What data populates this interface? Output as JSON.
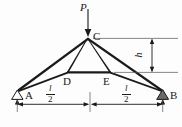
{
  "figure": {
    "type": "structural-truss-diagram",
    "background_color": "#fdfdfd",
    "line_color": "#1a1a1a",
    "labels": {
      "load": "P",
      "apex": "C",
      "left_support": "A",
      "right_support": "B",
      "left_tie_node": "D",
      "right_tie_node": "E",
      "height": "h"
    },
    "dimensions": {
      "left_span_numerator": "l",
      "left_span_denominator": "2",
      "right_span_numerator": "l",
      "right_span_denominator": "2"
    },
    "geometry": {
      "apex_c": [
        88,
        38
      ],
      "support_a": [
        17,
        90
      ],
      "support_b": [
        163,
        90
      ],
      "node_d": [
        68,
        72
      ],
      "node_e": [
        110,
        72
      ],
      "load_arrow_top": [
        88,
        8
      ],
      "load_arrow_bottom": [
        88,
        36
      ],
      "height_dim_x": 152,
      "height_dim_top": 38,
      "height_dim_bottom": 72,
      "span_dim_y": 104,
      "span_mid_x": 90
    },
    "supports": {
      "left_type": "pin-outline-triangle",
      "right_type": "pin-filled-triangle"
    }
  }
}
